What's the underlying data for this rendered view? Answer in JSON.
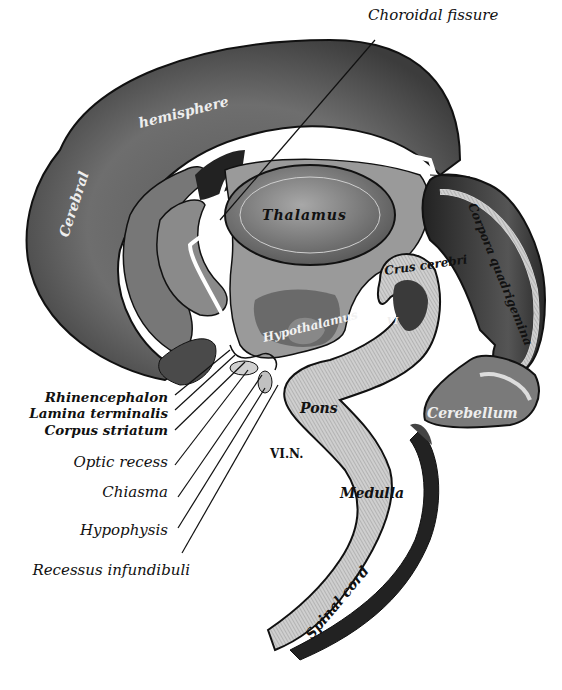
{
  "figure": {
    "type": "anatomical illustration"
  },
  "labels": {
    "choroidal_fissure": "Choroidal fissure",
    "cerebral": "Cerebral",
    "hemisphere": "hemisphere",
    "thalamus": "Thalamus",
    "corpora_quadrigemina": "Corpora quadrigemina",
    "crus_cerebri": "Crus cerebri",
    "hypothalamus": "Hypothalamus",
    "roman_vi": "VI",
    "pons": "Pons",
    "cerebellum": "Cerebellum",
    "vi_n": "VI.N.",
    "medulla": "Medulla",
    "spinal_cord": "Spinal cord",
    "rhinencephalon": "Rhinencephalon",
    "lamina_terminalis": "Lamina terminalis",
    "corpus_striatum": "Corpus striatum",
    "optic_recess": "Optic recess",
    "chiasma": "Chiasma",
    "hypophysis": "Hypophysis",
    "recessus_infundibuli": "Recessus infundibuli"
  },
  "colors": {
    "ink": "#111111",
    "dark_tone": "#3a3a3a",
    "mid_tone": "#7a7a7a",
    "light_tone": "#b5b5b5",
    "pale_tone": "#d6d6d6",
    "paper": "#ffffff"
  }
}
